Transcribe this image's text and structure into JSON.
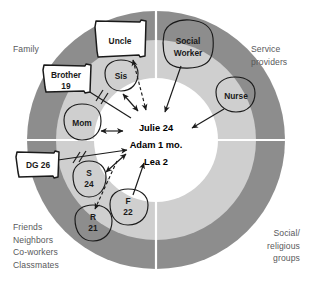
{
  "diagram": {
    "type": "ecomap",
    "colors": {
      "outer_ring": "#8d8d8d",
      "inner_ring": "#cfcfcf",
      "center": "#ffffff",
      "divider": "#ffffff",
      "outline": "#1a1a1a",
      "quadrant_label": "#58595b"
    },
    "geometry": {
      "cx": 156,
      "cy": 140,
      "r_outer": 129,
      "r_inner": 100,
      "r_center": 62
    }
  },
  "quadrants": [
    {
      "id": "family",
      "label": "Family",
      "position": "top-left"
    },
    {
      "id": "service",
      "label": "Service\nproviders",
      "position": "top-right"
    },
    {
      "id": "friends",
      "label": "Friends\nNeighbors\nCo-workers\nClassmates",
      "position": "bottom-left"
    },
    {
      "id": "social",
      "label": "Social/\nreligious\ngroups",
      "position": "bottom-right"
    }
  ],
  "center": {
    "lines": [
      "Julie 24",
      "Adam 1 mo.",
      "Lea 2"
    ],
    "members": [
      {
        "name": "Julie",
        "age": "24"
      },
      {
        "name": "Adam",
        "age": "1 mo."
      },
      {
        "name": "Lea",
        "age": "2"
      }
    ]
  },
  "nodes": [
    {
      "id": "uncle",
      "label": "Uncle",
      "lines": [
        "Uncle"
      ],
      "shape": "flag",
      "quadrant": "family",
      "x": 118,
      "y": 40
    },
    {
      "id": "social-worker",
      "label": "Social Worker",
      "lines": [
        "Social",
        "Worker"
      ],
      "shape": "blob",
      "quadrant": "service",
      "x": 187,
      "y": 46
    },
    {
      "id": "sis",
      "label": "Sis",
      "lines": [
        "Sis"
      ],
      "shape": "blob",
      "quadrant": "family",
      "x": 121,
      "y": 78
    },
    {
      "id": "brother",
      "label": "Brother 19",
      "lines": [
        "Brother",
        "19"
      ],
      "shape": "flag",
      "quadrant": "family",
      "x": 65,
      "y": 82
    },
    {
      "id": "nurse",
      "label": "Nurse",
      "lines": [
        "Nurse"
      ],
      "shape": "blob",
      "quadrant": "service",
      "x": 235,
      "y": 96
    },
    {
      "id": "mom",
      "label": "Mom",
      "lines": [
        "Mom"
      ],
      "shape": "blob",
      "quadrant": "family",
      "x": 81,
      "y": 123
    },
    {
      "id": "dg",
      "label": "DG 26",
      "lines": [
        "DG 26"
      ],
      "shape": "flag",
      "quadrant": "friends",
      "x": 38,
      "y": 166
    },
    {
      "id": "s",
      "label": "S 24",
      "lines": [
        "S",
        "24"
      ],
      "shape": "blob",
      "quadrant": "friends",
      "x": 88,
      "y": 180
    },
    {
      "id": "f",
      "label": "F 22",
      "lines": [
        "F",
        "22"
      ],
      "shape": "blob",
      "quadrant": "friends",
      "x": 128,
      "y": 206
    },
    {
      "id": "r",
      "label": "R 21",
      "lines": [
        "R",
        "21"
      ],
      "shape": "blob",
      "quadrant": "friends",
      "x": 93,
      "y": 224
    }
  ],
  "connections": [
    {
      "from": "uncle",
      "to": "center",
      "style": "dashed",
      "arrows": "both",
      "note": "tenuous"
    },
    {
      "from": "social-worker",
      "to": "center",
      "style": "solid",
      "arrows": "to",
      "note": ""
    },
    {
      "from": "nurse",
      "to": "center",
      "style": "solid",
      "arrows": "to",
      "note": ""
    },
    {
      "from": "sis",
      "to": "center",
      "style": "solid",
      "arrows": "both",
      "note": ""
    },
    {
      "from": "brother",
      "to": "center",
      "style": "solid-hash",
      "arrows": "none",
      "note": "stressful"
    },
    {
      "from": "mom",
      "to": "center",
      "style": "solid",
      "arrows": "both",
      "note": ""
    },
    {
      "from": "dg",
      "to": "center",
      "style": "solid-hash",
      "arrows": "to",
      "note": "stressful"
    },
    {
      "from": "s",
      "to": "center",
      "style": "solid",
      "arrows": "both",
      "note": ""
    },
    {
      "from": "s",
      "to": "r",
      "style": "dashed",
      "arrows": "to",
      "note": "tenuous"
    },
    {
      "from": "f",
      "to": "center",
      "style": "solid",
      "arrows": "to",
      "note": ""
    }
  ]
}
